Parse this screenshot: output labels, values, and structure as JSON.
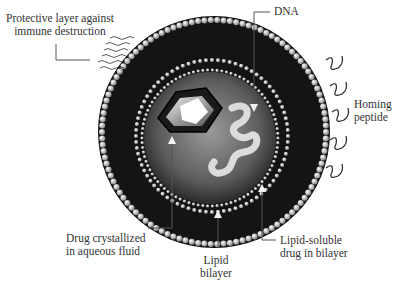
{
  "diagram": {
    "labels": {
      "protective_layer": [
        "Protective layer against",
        "immune destruction"
      ],
      "dna": "DNA",
      "homing_peptide": [
        "Homing",
        "peptide"
      ],
      "drug_crystallized": [
        "Drug crystallized",
        "in aqueous fluid"
      ],
      "lipid_bilayer": [
        "Lipid",
        "bilayer"
      ],
      "lipid_soluble_drug": [
        "Lipid-soluble",
        "drug in bilayer"
      ]
    },
    "colors": {
      "bilayer_dark": "#111111",
      "lipid_head": "#bdbdbd",
      "aqueous_core": "#6e6e6e",
      "leader_line": "#555555"
    }
  }
}
